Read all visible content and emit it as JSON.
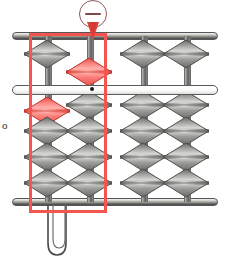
{
  "device": {
    "name": "abacus",
    "type": "soroban",
    "background_color": "#ffffff"
  },
  "frame": {
    "top_rail": "top-frame-rail",
    "bottom_rail": "bottom-frame-rail",
    "reckoning_bar": "reckoning-bar",
    "bar_marker_dot": "unit-dot",
    "rail_color": "#8e8e8a",
    "beam_color": "#fdfdfd"
  },
  "colors": {
    "bead_gray_light": "#d9d9d6",
    "bead_gray_mid": "#9b9b97",
    "bead_gray_dark": "#6a6a67",
    "bead_red_light": "#ffb3ae",
    "bead_red_mid": "#fa7b76",
    "bead_red_dark": "#e8524c",
    "highlight_red": "#f4564f",
    "outline": "#55555a"
  },
  "annotation": {
    "highlight_box": "column-highlight",
    "highlight_color": "#f4564f",
    "badge": {
      "name": "minus-badge",
      "symbol": "−",
      "label": "minus",
      "pointer": "pin-pointer",
      "points_at_column": 2
    },
    "margin_glyph": "o"
  },
  "stand": {
    "name": "wire-stand",
    "shape": "u-shaped-leg"
  },
  "abacus": {
    "column_count": 4,
    "heaven_beads_per_column": 1,
    "earth_beads_per_column": 4,
    "columns": [
      {
        "index": 1,
        "x": 47,
        "heaven": [
          {
            "color": "gray",
            "position": "up"
          }
        ],
        "earth": [
          {
            "color": "red",
            "position": "up"
          },
          {
            "color": "gray",
            "position": "down"
          },
          {
            "color": "gray",
            "position": "down"
          },
          {
            "color": "gray",
            "position": "down"
          }
        ]
      },
      {
        "index": 2,
        "x": 89,
        "heaven": [
          {
            "color": "red",
            "position": "down"
          }
        ],
        "earth": [
          {
            "color": "gray",
            "position": "down"
          },
          {
            "color": "gray",
            "position": "down"
          },
          {
            "color": "gray",
            "position": "down"
          },
          {
            "color": "gray",
            "position": "down"
          }
        ]
      },
      {
        "index": 3,
        "x": 143,
        "heaven": [
          {
            "color": "gray",
            "position": "up"
          }
        ],
        "earth": [
          {
            "color": "gray",
            "position": "down"
          },
          {
            "color": "gray",
            "position": "down"
          },
          {
            "color": "gray",
            "position": "down"
          },
          {
            "color": "gray",
            "position": "down"
          }
        ]
      },
      {
        "index": 4,
        "x": 186,
        "heaven": [
          {
            "color": "gray",
            "position": "up"
          }
        ],
        "earth": [
          {
            "color": "gray",
            "position": "down"
          },
          {
            "color": "gray",
            "position": "down"
          },
          {
            "color": "gray",
            "position": "down"
          },
          {
            "color": "gray",
            "position": "down"
          }
        ]
      }
    ]
  }
}
